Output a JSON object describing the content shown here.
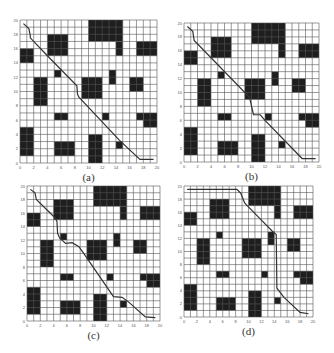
{
  "figure": {
    "grid_size": 20,
    "tick_step": 2,
    "x_ticks": [
      "0",
      "2",
      "4",
      "6",
      "8",
      "10",
      "12",
      "14",
      "16",
      "18",
      "20"
    ],
    "y_ticks": [
      "0",
      "2",
      "4",
      "6",
      "8",
      "10",
      "12",
      "14",
      "16",
      "18",
      "20"
    ],
    "colors": {
      "obstacle": "#1e1e1e",
      "grid_line": "#555555",
      "path": "#333333",
      "background": "#ffffff"
    },
    "obstacles": [
      {
        "x0": 10,
        "x1": 15,
        "y0": 17,
        "y1": 20
      },
      {
        "x0": 14,
        "x1": 15,
        "y0": 15,
        "y1": 17
      },
      {
        "x0": 4,
        "x1": 7,
        "y0": 15,
        "y1": 18
      },
      {
        "x0": 0,
        "x1": 2,
        "y0": 14,
        "y1": 16
      },
      {
        "x0": 17,
        "x1": 20,
        "y0": 15,
        "y1": 17
      },
      {
        "x0": 5,
        "x1": 6,
        "y0": 12,
        "y1": 13
      },
      {
        "x0": 13,
        "x1": 14,
        "y0": 11,
        "y1": 13
      },
      {
        "x0": 2,
        "x1": 4,
        "y0": 8,
        "y1": 12
      },
      {
        "x0": 9,
        "x1": 12,
        "y0": 9,
        "y1": 12
      },
      {
        "x0": 16,
        "x1": 18,
        "y0": 10,
        "y1": 12
      },
      {
        "x0": 5,
        "x1": 7,
        "y0": 6,
        "y1": 7
      },
      {
        "x0": 12,
        "x1": 13,
        "y0": 6,
        "y1": 7
      },
      {
        "x0": 17,
        "x1": 18,
        "y0": 6,
        "y1": 7
      },
      {
        "x0": 18,
        "x1": 20,
        "y0": 5,
        "y1": 7
      },
      {
        "x0": 0,
        "x1": 2,
        "y0": 1,
        "y1": 5
      },
      {
        "x0": 5,
        "x1": 8,
        "y0": 1,
        "y1": 3
      },
      {
        "x0": 10,
        "x1": 12,
        "y0": 0,
        "y1": 4
      },
      {
        "x0": 14,
        "x1": 15,
        "y0": 2,
        "y1": 3
      }
    ]
  },
  "panels": [
    {
      "id": "a",
      "caption": "(a)",
      "box": {
        "left": 20,
        "top": 20,
        "width": 137,
        "height": 143
      },
      "path": [
        [
          0.5,
          19.5
        ],
        [
          1.3,
          18.8
        ],
        [
          1.5,
          17.8
        ],
        [
          1.5,
          17.5
        ],
        [
          4.0,
          15.0
        ],
        [
          8.3,
          10.8
        ],
        [
          8.4,
          9.6
        ],
        [
          8.6,
          9.2
        ],
        [
          14.5,
          3.2
        ],
        [
          17.5,
          0.5
        ],
        [
          19.5,
          0.5
        ]
      ]
    },
    {
      "id": "b",
      "caption": "(b)",
      "box": {
        "left": 184,
        "top": 23,
        "width": 135,
        "height": 139
      },
      "path": [
        [
          0.5,
          19.5
        ],
        [
          1.3,
          18.8
        ],
        [
          1.5,
          17.5
        ],
        [
          4.0,
          15.0
        ],
        [
          9.7,
          9.3
        ],
        [
          10.3,
          6.8
        ],
        [
          11.3,
          6.8
        ],
        [
          12.0,
          6.0
        ],
        [
          17.5,
          0.5
        ],
        [
          19.5,
          0.5
        ]
      ]
    },
    {
      "id": "c",
      "caption": "(c)",
      "box": {
        "left": 27,
        "top": 186,
        "width": 133,
        "height": 135
      },
      "path": [
        [
          0.5,
          19.5
        ],
        [
          1.2,
          19.0
        ],
        [
          1.4,
          18.0
        ],
        [
          4.2,
          15.3
        ],
        [
          4.5,
          14.8
        ],
        [
          4.6,
          13.0
        ],
        [
          4.9,
          12.3
        ],
        [
          5.8,
          11.5
        ],
        [
          6.8,
          11.6
        ],
        [
          7.8,
          11.0
        ],
        [
          8.4,
          10.2
        ],
        [
          13.0,
          3.6
        ],
        [
          14.3,
          3.5
        ],
        [
          15.3,
          2.8
        ],
        [
          17.8,
          0.6
        ],
        [
          19.3,
          0.5
        ]
      ]
    },
    {
      "id": "d",
      "caption": "(d)",
      "box": {
        "left": 184,
        "top": 186,
        "width": 129,
        "height": 131
      },
      "path": [
        [
          0.5,
          19.5
        ],
        [
          8.2,
          19.5
        ],
        [
          8.8,
          18.9
        ],
        [
          9.4,
          17.4
        ],
        [
          10.1,
          16.7
        ],
        [
          12.0,
          14.8
        ],
        [
          13.7,
          13.1
        ],
        [
          14.3,
          12.6
        ],
        [
          14.4,
          4.4
        ],
        [
          15.5,
          3.0
        ],
        [
          18.0,
          0.7
        ],
        [
          19.3,
          0.5
        ]
      ]
    }
  ]
}
